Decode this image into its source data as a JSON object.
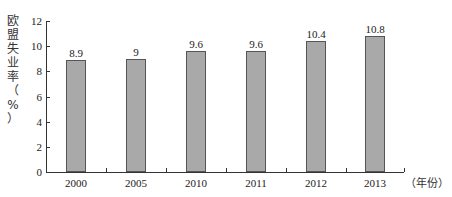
{
  "chart_data": {
    "type": "bar",
    "title": "",
    "categories": [
      "2000",
      "2005",
      "2010",
      "2011",
      "2012",
      "2013"
    ],
    "values": [
      8.9,
      9,
      9.6,
      9.6,
      10.4,
      10.8
    ],
    "data_labels": [
      "8.9",
      "9",
      "9.6",
      "9.6",
      "10.4",
      "10.8"
    ],
    "xlabel": "（年份）",
    "ylabel": "欧盟失业率（%）",
    "ylim": [
      0,
      12
    ],
    "yticks": [
      "0",
      "2",
      "4",
      "6",
      "8",
      "10",
      "12"
    ],
    "grid": false,
    "legend": null,
    "bar_color": "#a9a9a9"
  },
  "axis": {
    "ylabel_chars": [
      "欧",
      "盟",
      "失",
      "业",
      "率",
      "（",
      "%",
      "）"
    ],
    "x_unit": "（年份）"
  }
}
